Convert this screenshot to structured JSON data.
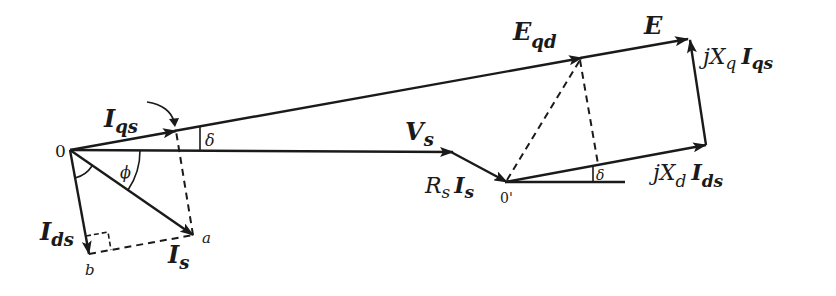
{
  "diagram": {
    "points": {
      "origin": {
        "label": "0"
      },
      "origin_prime": {
        "label": "0'"
      },
      "a": {
        "label": "a"
      },
      "b": {
        "label": "b"
      }
    },
    "vectors": {
      "Iqs": {
        "main": "I",
        "sub": "qs"
      },
      "Ids": {
        "main": "I",
        "sub": "ds"
      },
      "Is": {
        "main": "I",
        "sub": "s"
      },
      "Vs": {
        "main": "V",
        "sub": "s"
      },
      "RsIs": {
        "r": "R",
        "r_sub": "s",
        "main": "I",
        "sub": "s"
      },
      "Eqd": {
        "main": "E",
        "sub": "qd"
      },
      "E": {
        "main": "E"
      },
      "jXqIqs": {
        "j": "jX",
        "x_sub": "q",
        "main": "I",
        "sub": "qs"
      },
      "jXdIds": {
        "j": "jX",
        "x_sub": "d",
        "main": "I",
        "sub": "ds"
      }
    },
    "angles": {
      "phi": "ϕ",
      "delta_top": "δ",
      "delta_bottom": "δ"
    }
  }
}
